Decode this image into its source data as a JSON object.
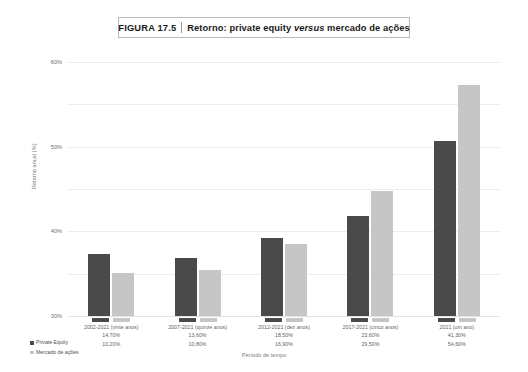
{
  "figure": {
    "number_label": "FIGURA 17.5",
    "title": "Retorno: private equity versus mercado de ações",
    "title_prefix": "Retorno: private equity ",
    "title_italic": "versus",
    "title_suffix": " mercado de ações"
  },
  "legend": {
    "position": "bottom-left",
    "items": [
      {
        "label": "Private Equity",
        "color": "#4a4a4a"
      },
      {
        "label": "Mercado de ações",
        "color": "#c6c6c6"
      }
    ]
  },
  "axes": {
    "ylabel": "Retorno anual (%)",
    "xlabel": "Período de tempo",
    "yticks": [
      "0%",
      "10%",
      "20%",
      "30%",
      "40%",
      "50%",
      "60%"
    ]
  },
  "chart_data": {
    "type": "bar",
    "title": "Retorno: private equity versus mercado de ações",
    "xlabel": "Período de tempo",
    "ylabel": "Retorno anual (%)",
    "ylim": [
      0,
      60
    ],
    "ytick_values": [
      0,
      10,
      20,
      30,
      40,
      50,
      60
    ],
    "ytick_labels": [
      "0%",
      "10%",
      "20%",
      "30%",
      "40%",
      "50%",
      "60%"
    ],
    "grid": true,
    "legend_position": "bottom-left",
    "categories": [
      "2002-2021 (vinte anos)",
      "2007-2021 (quinze anos)",
      "2012-2021 (dez anos)",
      "2017-2021 (cinco anos)",
      "2021 (um ano)"
    ],
    "series": [
      {
        "name": "Private Equity",
        "color": "#4a4a4a",
        "values": [
          14.7,
          13.6,
          18.5,
          23.6,
          41.3
        ],
        "labels": [
          "14,70%",
          "13,60%",
          "18,50%",
          "23,60%",
          "41,30%"
        ]
      },
      {
        "name": "Mercado de ações",
        "color": "#c6c6c6",
        "values": [
          10.2,
          10.8,
          16.9,
          29.5,
          54.6
        ],
        "labels": [
          "10,20%",
          "10,80%",
          "16,90%",
          "29,50%",
          "54,60%"
        ]
      }
    ]
  }
}
